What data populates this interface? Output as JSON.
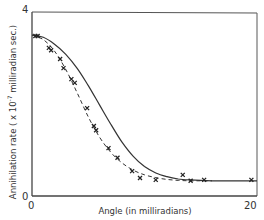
{
  "chart_data": {
    "type": "line",
    "title": "",
    "xlabel": "Angle (in milliradians)",
    "ylabel": "Annihilation rate (x10^-7 milliradian sec.)",
    "ylabel_main": "Annihilation rate ( x 10",
    "ylabel_exp": "-7",
    "ylabel_tail": " milliradian sec.)",
    "xlim": [
      0,
      20
    ],
    "ylim": [
      0,
      4
    ],
    "x_ticks": [
      "0",
      "20"
    ],
    "y_ticks": [
      "0",
      "4"
    ],
    "grid": false,
    "legend": "none",
    "series": [
      {
        "name": "solid curve (theory)",
        "style": "solid",
        "x": [
          0,
          1,
          2,
          3,
          4,
          5,
          6,
          7,
          8,
          9,
          10,
          11,
          12,
          13,
          14,
          15,
          16,
          17,
          18,
          19,
          20
        ],
        "y": [
          3.5,
          3.45,
          3.3,
          3.08,
          2.78,
          2.4,
          1.98,
          1.56,
          1.17,
          0.86,
          0.64,
          0.5,
          0.42,
          0.37,
          0.35,
          0.34,
          0.33,
          0.33,
          0.33,
          0.33,
          0.33
        ]
      },
      {
        "name": "dashed curve (fit)",
        "style": "dashed",
        "x": [
          0,
          1,
          2,
          3,
          4,
          5,
          6,
          7,
          8,
          9,
          10,
          11,
          12,
          13,
          14,
          15,
          16
        ],
        "y": [
          3.5,
          3.4,
          3.15,
          2.75,
          2.25,
          1.72,
          1.28,
          0.95,
          0.72,
          0.56,
          0.46,
          0.4,
          0.36,
          0.34,
          0.33,
          0.33,
          0.33
        ]
      },
      {
        "name": "measured points",
        "style": "markers-x",
        "x": [
          0.3,
          0.5,
          1.5,
          1.7,
          2.5,
          2.8,
          3.5,
          3.8,
          4.9,
          5.5,
          5.7,
          6.8,
          7.6,
          8.9,
          9.6,
          11.0,
          13.4,
          14.1,
          15.3,
          19.5
        ],
        "y": [
          3.48,
          3.48,
          3.22,
          3.17,
          2.98,
          2.78,
          2.54,
          2.46,
          1.91,
          1.52,
          1.43,
          1.04,
          0.83,
          0.54,
          0.39,
          0.35,
          0.46,
          0.33,
          0.35,
          0.35
        ]
      }
    ]
  }
}
